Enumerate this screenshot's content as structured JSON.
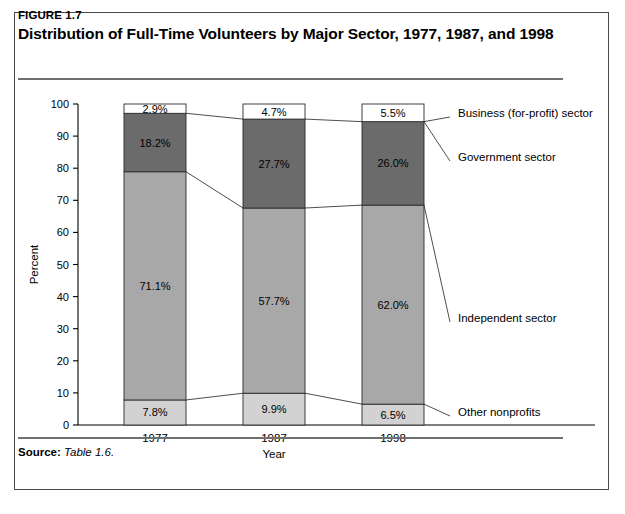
{
  "figure": {
    "number": "FIGURE 1.7",
    "title": "Distribution of Full-Time Volunteers by Major Sector, 1977, 1987, and 1998",
    "source_label": "Source:",
    "source_value": "Table 1.6."
  },
  "chart_data": {
    "type": "bar",
    "subtype": "stacked-100",
    "title": "Distribution of Full-Time Volunteers by Major Sector, 1977, 1987, and 1998",
    "xlabel": "Year",
    "ylabel": "Percent",
    "categories": [
      "1977",
      "1987",
      "1998"
    ],
    "ylim": [
      0,
      100
    ],
    "yticks": [
      0,
      10,
      20,
      30,
      40,
      50,
      60,
      70,
      80,
      90,
      100
    ],
    "ytick_labels": [
      "0",
      "10",
      "20",
      "30",
      "40",
      "50",
      "60",
      "70",
      "80",
      "90",
      "100"
    ],
    "grid": false,
    "legend_position": "right-inline",
    "series": [
      {
        "name": "Other nonprofits",
        "color": "#d2d2d2",
        "values": [
          7.8,
          9.9,
          6.5
        ],
        "labels": [
          "7.8%",
          "9.9%",
          "6.5%"
        ]
      },
      {
        "name": "Independent sector",
        "color": "#a8a8a8",
        "values": [
          71.1,
          57.7,
          62.0
        ],
        "labels": [
          "71.1%",
          "57.7%",
          "62.0%"
        ]
      },
      {
        "name": "Government sector",
        "color": "#6b6b6b",
        "values": [
          18.2,
          27.7,
          26.0
        ],
        "labels": [
          "18.2%",
          "27.7%",
          "26.0%"
        ]
      },
      {
        "name": "Business (for-profit) sector",
        "color": "#ffffff",
        "values": [
          2.9,
          4.7,
          5.5
        ],
        "labels": [
          "2.9%",
          "4.7%",
          "5.5%"
        ]
      }
    ]
  },
  "legend": {
    "items": [
      "Business (for-profit) sector",
      "Government sector",
      "Independent sector",
      "Other nonprofits"
    ]
  },
  "colors": {
    "border": "#4a4a4a",
    "rule": "#6f6f6f",
    "segment_outline": "#2b2b2b",
    "connector": "#3a3a3a"
  }
}
